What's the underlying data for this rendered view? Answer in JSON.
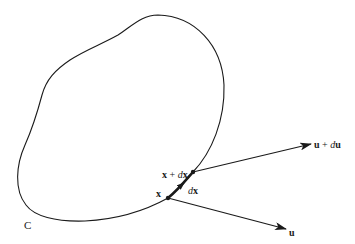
{
  "figure": {
    "type": "vector-field-curve-diagram",
    "curve_label": "C",
    "points": [
      {
        "id": "x",
        "label": "x"
      },
      {
        "id": "x_plus_dx",
        "label_bold": "x",
        "label_op": " + ",
        "label_d": "d",
        "label_var": "x"
      }
    ],
    "segment": {
      "label_d": "d",
      "label_var": "x"
    },
    "vectors": [
      {
        "id": "u",
        "label": "u"
      },
      {
        "id": "u_plus_du",
        "label_bold": "u",
        "label_op": " + ",
        "label_d": "d",
        "label_var": "u"
      }
    ],
    "colors": {
      "stroke": "#1a1a1a",
      "background": "#ffffff"
    }
  }
}
